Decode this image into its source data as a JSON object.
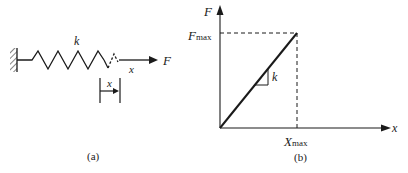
{
  "panel_a": {
    "caption": "(a)",
    "spring_label": "k",
    "force_label": "F",
    "displacement_label": "x",
    "bracket_label": "x"
  },
  "panel_b": {
    "caption": "(b)",
    "y_axis_label": "F",
    "x_axis_label": "x",
    "y_max_label_main": "F",
    "y_max_label_sub": "max",
    "x_max_label_main": "X",
    "x_max_label_sub": "max",
    "slope_label": "k"
  },
  "colors": {
    "ink": "#1a1a1a",
    "background": "#ffffff"
  }
}
